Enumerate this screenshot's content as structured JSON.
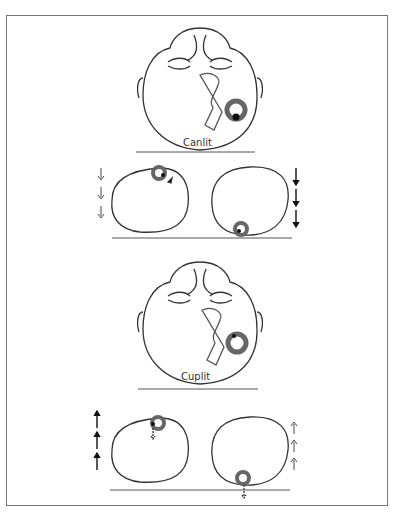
{
  "figure": {
    "panels": [
      {
        "id": "top",
        "label": "Canlit"
      },
      {
        "id": "bottom",
        "label": "Cuplit"
      }
    ],
    "colors": {
      "line": "#333333",
      "canal_ring": "#666666",
      "otolith": "#111111",
      "frame": "#777777"
    }
  }
}
